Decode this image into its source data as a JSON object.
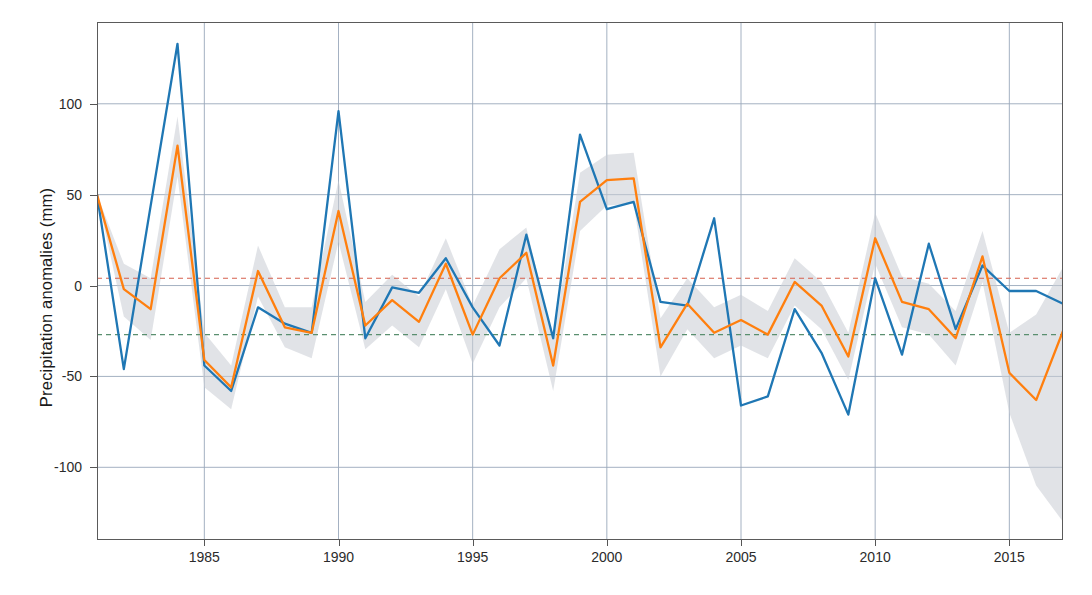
{
  "chart_data": {
    "type": "line",
    "title": "",
    "xlabel": "",
    "ylabel": "Precipitation anomalies (mm)",
    "xlim": [
      1981,
      2017
    ],
    "ylim": [
      -140,
      145
    ],
    "xticks": [
      1985,
      1990,
      1995,
      2000,
      2005,
      2010,
      2015
    ],
    "xtick_labels": [
      "1985",
      "1990",
      "1995",
      "2000",
      "2005",
      "2010",
      "2015"
    ],
    "yticks": [
      100,
      50,
      0,
      -50,
      -100
    ],
    "ytick_labels": [
      "100",
      "50",
      "0",
      "-50",
      "-100"
    ],
    "grid": true,
    "legend": "none",
    "x": [
      1981,
      1982,
      1983,
      1984,
      1985,
      1986,
      1987,
      1988,
      1989,
      1990,
      1991,
      1992,
      1993,
      1994,
      1995,
      1996,
      1997,
      1998,
      1999,
      2000,
      2001,
      2002,
      2003,
      2004,
      2005,
      2006,
      2007,
      2008,
      2009,
      2010,
      2011,
      2012,
      2013,
      2014,
      2015,
      2016,
      2017
    ],
    "series": [
      {
        "name": "observed",
        "color": "#1f77b4",
        "values": [
          50,
          -46,
          44,
          133,
          -44,
          -58,
          -12,
          -21,
          -26,
          96,
          -29,
          -1,
          -4,
          15,
          -12,
          -33,
          28,
          -29,
          83,
          42,
          46,
          -9,
          -11,
          37,
          -66,
          -61,
          -13,
          -37,
          -71,
          4,
          -38,
          23,
          -24,
          11,
          -3,
          -3,
          -10
        ]
      },
      {
        "name": "modelled",
        "color": "#ff7f0e",
        "values": [
          50,
          -2,
          -13,
          77,
          -41,
          -56,
          8,
          -23,
          -26,
          41,
          -22,
          -8,
          -20,
          12,
          -27,
          4,
          18,
          -44,
          46,
          58,
          59,
          -34,
          -10,
          -26,
          -19,
          -27,
          2,
          -11,
          -39,
          26,
          -9,
          -13,
          -29,
          16,
          -48,
          -63,
          -25
        ]
      }
    ],
    "uncertainty_band": {
      "color": "#c8ccd4",
      "around_series": "modelled",
      "lower": [
        50,
        -17,
        -30,
        60,
        -56,
        -68,
        -6,
        -34,
        -40,
        24,
        -35,
        -22,
        -34,
        -2,
        -43,
        -12,
        4,
        -58,
        30,
        44,
        45,
        -50,
        -24,
        -40,
        -33,
        -40,
        -11,
        -24,
        -52,
        12,
        -23,
        -27,
        -44,
        2,
        -70,
        -110,
        -130
      ],
      "upper": [
        50,
        12,
        4,
        93,
        -26,
        -44,
        22,
        -12,
        -12,
        58,
        -9,
        6,
        -6,
        26,
        -11,
        20,
        32,
        -30,
        62,
        72,
        73,
        -18,
        4,
        -12,
        -5,
        -14,
        15,
        2,
        -26,
        40,
        5,
        1,
        -14,
        30,
        -26,
        -16,
        10
      ]
    },
    "reference_lines": [
      {
        "name": "red-reference-line",
        "value": 4,
        "color": "#d6604d",
        "style": "dashed"
      },
      {
        "name": "green-reference-line",
        "value": -27,
        "color": "#5a8f6f",
        "style": "dashed"
      }
    ]
  }
}
